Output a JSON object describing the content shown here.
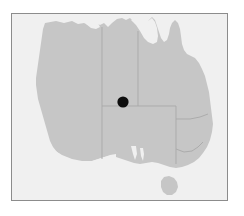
{
  "map": {
    "title": "Australia",
    "frame": {
      "border_color": "#8c8c8c",
      "background_color": "#f0f0f0"
    },
    "land_color": "#c6c6c6",
    "border_color": "#a8a8a8",
    "marker_color": "#0d0d0d",
    "regions": [
      {
        "code": "WA",
        "name": "Western Australia"
      },
      {
        "code": "NT",
        "name": "Northern Territory"
      },
      {
        "code": "SA",
        "name": "South Australia"
      },
      {
        "code": "QLD",
        "name": "Queensland"
      },
      {
        "code": "NSW",
        "name": "New South Wales"
      },
      {
        "code": "VIC",
        "name": "Victoria"
      },
      {
        "code": "TAS",
        "name": "Tasmania"
      }
    ],
    "marker": {
      "label": "Location marker",
      "region": "Northern Territory",
      "x_px": 122,
      "y_px": 101,
      "radius_px": 5.5
    }
  }
}
